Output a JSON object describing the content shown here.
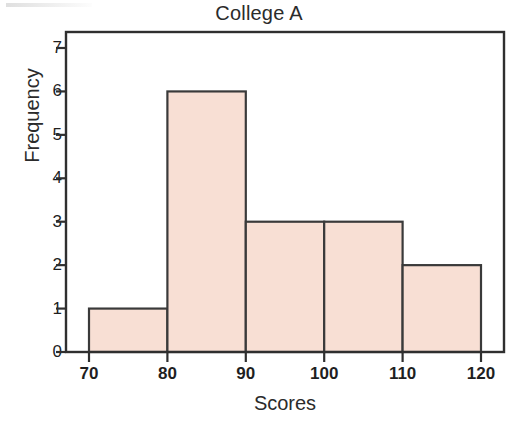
{
  "chart_data": {
    "type": "bar",
    "title": "College A",
    "xlabel": "Scores",
    "ylabel": "Frequency",
    "categories": [
      "70-80",
      "80-90",
      "90-100",
      "100-110",
      "110-120"
    ],
    "bin_edges": [
      70,
      80,
      90,
      100,
      110,
      120
    ],
    "values": [
      1,
      6,
      3,
      3,
      2
    ],
    "xtick_labels": [
      "70",
      "80",
      "90",
      "100",
      "110",
      "120"
    ],
    "xtick_values": [
      70,
      80,
      90,
      100,
      110,
      120
    ],
    "ytick_labels": [
      "0",
      "1",
      "2",
      "3",
      "4",
      "5",
      "6",
      "7"
    ],
    "ytick_values": [
      0,
      1,
      2,
      3,
      4,
      5,
      6,
      7
    ],
    "xlim": [
      65.6,
      121.6
    ],
    "ylim": [
      0,
      7.37
    ],
    "grid": false,
    "legend": null,
    "bar_fill_color": "#f8dfd4",
    "bar_stroke_color": "#3a3a3a",
    "axis_color": "#2f2f2f",
    "text_color": "#1f1f1f"
  }
}
